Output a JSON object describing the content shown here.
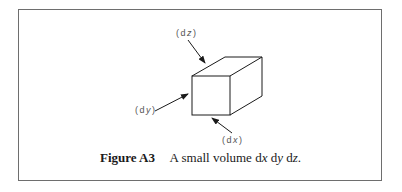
{
  "figure": {
    "number_label": "Figure A3",
    "caption_text": "A small volume",
    "caption_math": [
      {
        "d": "d",
        "var": "x"
      },
      {
        "d": "d",
        "var": "y"
      },
      {
        "d": "d",
        "var": "z"
      }
    ],
    "caption_end": ".",
    "labels": {
      "dz": {
        "open": "(d",
        "var": "z",
        "close": ")"
      },
      "dy": {
        "open": "(d",
        "var": "y",
        "close": ")"
      },
      "dx": {
        "open": "(d",
        "var": "x",
        "close": ")"
      }
    },
    "colors": {
      "frame": "#6e6e6e",
      "lines": "#1a1a1a",
      "labels": "#555555"
    }
  }
}
